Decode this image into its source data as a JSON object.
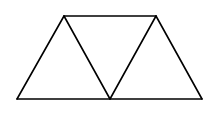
{
  "diagram": {
    "type": "geometry",
    "stroke_color": "#000000",
    "background": "#ffffff",
    "vertices": {
      "A": [
        64,
        16
      ],
      "B": [
        156,
        16
      ],
      "C": [
        17,
        99
      ],
      "D": [
        110,
        99
      ],
      "E": [
        202,
        99
      ]
    },
    "edges": [
      [
        "A",
        "B"
      ],
      [
        "C",
        "E"
      ],
      [
        "C",
        "A"
      ],
      [
        "A",
        "D"
      ],
      [
        "D",
        "B"
      ],
      [
        "B",
        "E"
      ]
    ],
    "triangles": [
      [
        "C",
        "A",
        "D"
      ],
      [
        "A",
        "B",
        "D"
      ],
      [
        "D",
        "B",
        "E"
      ]
    ],
    "labels": []
  }
}
